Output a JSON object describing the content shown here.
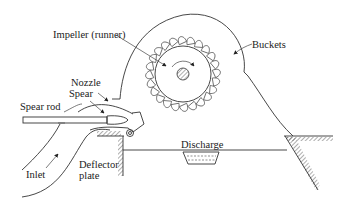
{
  "figure": {
    "type": "Pelton wheel turbine schematic",
    "labels": {
      "impeller": "Impeller (runner)",
      "buckets": "Buckets",
      "nozzle": "Nozzle",
      "spear": "Spear",
      "spear_rod": "Spear rod",
      "deflector_line1": "Deflector",
      "deflector_line2": "plate",
      "inlet": "Inlet",
      "discharge": "Discharge"
    },
    "colors": {
      "line": "#333333",
      "background": "#ffffff"
    },
    "runner": {
      "center_x": 183,
      "center_y": 74,
      "hub_radius": 28,
      "bucket_count": 24,
      "casing_radius": 60
    }
  }
}
